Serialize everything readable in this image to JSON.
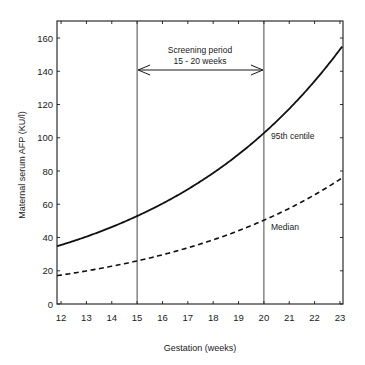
{
  "chart_data": {
    "type": "line",
    "title": "",
    "xlabel": "Gestation (weeks)",
    "ylabel": "Maternal serum AFP (KU/l)",
    "xlim": [
      11.84,
      23.12
    ],
    "ylim": [
      0,
      160
    ],
    "x_ticks": [
      12,
      13,
      14,
      15,
      16,
      17,
      18,
      19,
      20,
      21,
      22,
      23
    ],
    "y_ticks": [
      0,
      20,
      40,
      60,
      80,
      100,
      120,
      140,
      160
    ],
    "grid": false,
    "legend": "none (inline labels)",
    "x": [
      12,
      13,
      14,
      15,
      16,
      17,
      18,
      19,
      20,
      21,
      22,
      23
    ],
    "series": [
      {
        "name": "95th centile",
        "style": "solid",
        "values": [
          35.5,
          40.5,
          46.3,
          52.9,
          60.4,
          69.0,
          78.8,
          90.0,
          102.8,
          117.4,
          134.1,
          153.1
        ]
      },
      {
        "name": "Median",
        "style": "dashed",
        "values": [
          17.4,
          19.9,
          22.7,
          25.9,
          29.6,
          33.8,
          38.6,
          44.1,
          50.4,
          57.5,
          65.7,
          75.0
        ]
      }
    ],
    "annotations": [
      {
        "text": "Screening period",
        "x": 17.5,
        "y": 152
      },
      {
        "text": "15 - 20 weeks",
        "x": 17.5,
        "y": 146
      },
      {
        "type": "double-arrow",
        "x_from": 15,
        "x_to": 20,
        "y": 141
      },
      {
        "type": "vline",
        "x": 15
      },
      {
        "type": "vline",
        "x": 20
      },
      {
        "text": "95th centile",
        "x": 20.3,
        "y": 101
      },
      {
        "text": "Median",
        "x": 20.3,
        "y": 46
      }
    ]
  },
  "labels": {
    "screening_line1": "Screening period",
    "screening_line2": "15 - 20 weeks",
    "centile95": "95th centile",
    "median": "Median",
    "xlabel": "Gestation (weeks)",
    "ylabel": "Maternal serum AFP (KU/l)"
  }
}
